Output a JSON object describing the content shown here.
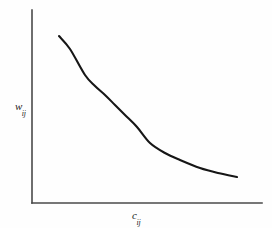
{
  "figure": {
    "width": 272,
    "height": 228,
    "background_color": "#fefefe",
    "style": "hand-drawn scanned line graph"
  },
  "axes": {
    "origin": {
      "x": 32,
      "y": 203
    },
    "y_axis": {
      "top_y": 10,
      "bottom_y": 203,
      "x": 32,
      "color": "#4a4a4a",
      "width": 1.6
    },
    "x_axis": {
      "left_x": 32,
      "right_x": 262,
      "y": 203,
      "color": "#4a4a4a",
      "width": 1.6
    },
    "y_label": {
      "variable": "w",
      "subscript": "ij"
    },
    "x_label": {
      "variable": "c",
      "subscript": "ij"
    },
    "ticks": [],
    "grid": false
  },
  "chart_data": {
    "type": "line",
    "title": "",
    "subtitle": "",
    "xlabel": "c_ij",
    "ylabel": "w_ij",
    "xlim": [
      0,
      1
    ],
    "ylim": [
      0,
      1
    ],
    "grid": false,
    "legend": null,
    "tick_labels": {
      "x": [],
      "y": []
    },
    "annotations": [],
    "series": [
      {
        "name": "weight decay",
        "description": "monotonically decreasing convex curve (exponential-like decay)",
        "color": "#161616",
        "line_width": 2.1,
        "x": [
          59,
          70,
          85,
          95,
          105,
          115,
          125,
          137,
          150,
          165,
          180,
          200,
          218,
          237
        ],
        "y": [
          36,
          49,
          75,
          86,
          95,
          105,
          115,
          127,
          143,
          153,
          160,
          168,
          173,
          177
        ]
      }
    ]
  }
}
